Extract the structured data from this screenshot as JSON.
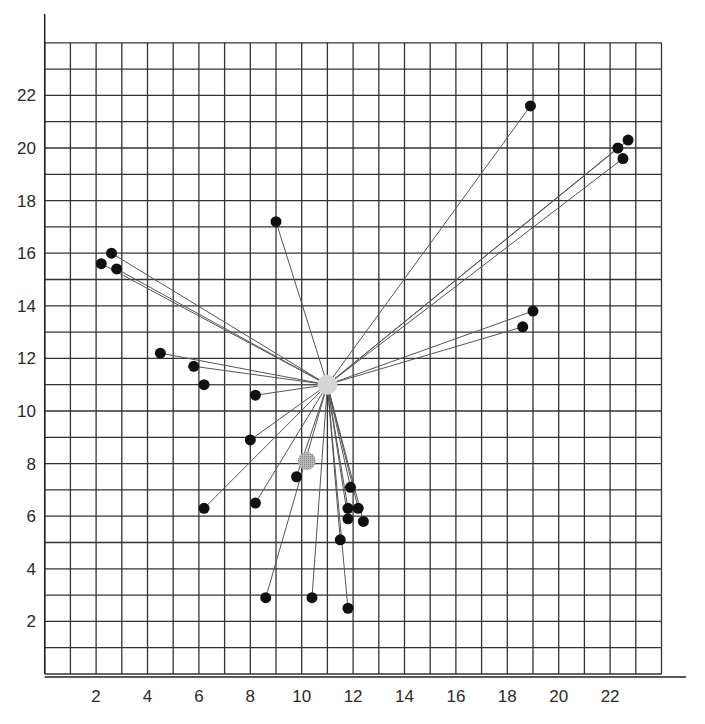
{
  "chart_data": {
    "type": "scatter",
    "title": "",
    "xlabel": "",
    "ylabel": "",
    "xlim": [
      0,
      24
    ],
    "ylim": [
      0,
      24
    ],
    "grid": true,
    "grid_step": 1,
    "x_ticks": [
      2,
      4,
      6,
      8,
      10,
      12,
      14,
      16,
      18,
      20,
      22
    ],
    "y_ticks": [
      2,
      4,
      6,
      8,
      10,
      12,
      14,
      16,
      18,
      20,
      22
    ],
    "legend": null,
    "hub": {
      "x": 11.0,
      "y": 11.0,
      "color": "#d6d6d6",
      "label": "central point"
    },
    "secondary_marker": {
      "x": 10.2,
      "y": 8.1,
      "color": "#a8a8a8",
      "style": "hatched"
    },
    "points": [
      {
        "x": 18.9,
        "y": 21.6
      },
      {
        "x": 22.3,
        "y": 20.0
      },
      {
        "x": 22.7,
        "y": 20.3
      },
      {
        "x": 22.5,
        "y": 19.6
      },
      {
        "x": 9.0,
        "y": 17.2
      },
      {
        "x": 2.6,
        "y": 16.0
      },
      {
        "x": 2.2,
        "y": 15.6
      },
      {
        "x": 2.8,
        "y": 15.4
      },
      {
        "x": 19.0,
        "y": 13.8
      },
      {
        "x": 18.6,
        "y": 13.2
      },
      {
        "x": 4.5,
        "y": 12.2
      },
      {
        "x": 5.8,
        "y": 11.7
      },
      {
        "x": 6.2,
        "y": 11.0
      },
      {
        "x": 8.2,
        "y": 10.6
      },
      {
        "x": 8.0,
        "y": 8.9
      },
      {
        "x": 9.8,
        "y": 7.5
      },
      {
        "x": 8.2,
        "y": 6.5
      },
      {
        "x": 6.2,
        "y": 6.3
      },
      {
        "x": 11.9,
        "y": 7.1
      },
      {
        "x": 11.8,
        "y": 6.3
      },
      {
        "x": 12.2,
        "y": 6.3
      },
      {
        "x": 11.8,
        "y": 5.9
      },
      {
        "x": 12.4,
        "y": 5.8
      },
      {
        "x": 11.5,
        "y": 5.1
      },
      {
        "x": 8.6,
        "y": 2.9
      },
      {
        "x": 10.4,
        "y": 2.9
      },
      {
        "x": 11.8,
        "y": 2.5
      }
    ],
    "point_color": "#111111",
    "line_color": "#555555",
    "grid_color": "#333333"
  }
}
